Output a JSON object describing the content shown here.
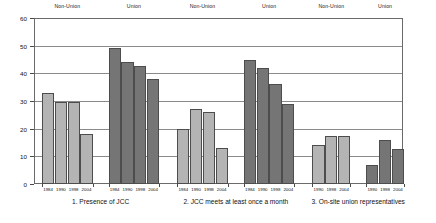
{
  "chart_data": {
    "type": "bar",
    "title": "",
    "xlabel": "",
    "ylabel": "",
    "ylim": [
      0,
      60
    ],
    "y_ticks": [
      0,
      10,
      20,
      30,
      40,
      50,
      60
    ],
    "grid": true,
    "legend_position": "none",
    "group_headers": [
      "Non-Union",
      "Union",
      "Non-Union",
      "Union",
      "Non-Union",
      "Union"
    ],
    "section_captions": [
      "1. Presence of JCC",
      "2. JCC meets at least once a month",
      "3. On-site union representatives"
    ],
    "series": [
      {
        "name": "Non-Union",
        "color": "#b4b4b4"
      },
      {
        "name": "Union",
        "color": "#757575"
      }
    ],
    "groups": [
      {
        "section": "1. Presence of JCC",
        "union_status": "Non-Union",
        "style": "light",
        "categories": [
          "1984",
          "1990",
          "1998",
          "2004"
        ],
        "values": [
          33,
          29.5,
          29.5,
          18
        ]
      },
      {
        "section": "1. Presence of JCC",
        "union_status": "Union",
        "style": "dark",
        "categories": [
          "1984",
          "1990",
          "1998",
          "2004"
        ],
        "values": [
          49,
          44,
          42.5,
          38
        ]
      },
      {
        "section": "2. JCC meets at least once a month",
        "union_status": "Non-Union",
        "style": "light",
        "categories": [
          "1984",
          "1990",
          "1998",
          "2004"
        ],
        "values": [
          20,
          27,
          26,
          13
        ]
      },
      {
        "section": "2. JCC meets at least once a month",
        "union_status": "Union",
        "style": "dark",
        "categories": [
          "1984",
          "1990",
          "1998",
          "2004"
        ],
        "values": [
          45,
          42,
          36,
          29
        ]
      },
      {
        "section": "3. On-site union representatives",
        "union_status": "Non-Union",
        "style": "light",
        "categories": [
          "1990",
          "1998",
          "2004"
        ],
        "values": [
          14,
          17.5,
          17.5
        ]
      },
      {
        "section": "3. On-site union representatives",
        "union_status": "Union",
        "style": "dark",
        "categories": [
          "1990",
          "1998",
          "2004"
        ],
        "values": [
          7,
          16,
          12.5
        ]
      }
    ]
  }
}
